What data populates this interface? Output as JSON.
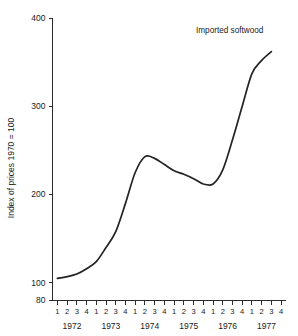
{
  "chart_data": {
    "type": "line",
    "title": "",
    "xlabel": "",
    "ylabel": "Index of prices 1970 = 100",
    "ylim": [
      80,
      400
    ],
    "yticks": [
      80,
      100,
      200,
      300,
      400
    ],
    "ytick_labels": [
      "80",
      "100",
      "200",
      "300",
      "400"
    ],
    "grid": false,
    "legend_position": "inline-annotation",
    "annotations": [
      {
        "text": "Imported softwood",
        "x": "1976 Q3",
        "y": 378
      }
    ],
    "years": [
      "1972",
      "1973",
      "1974",
      "1975",
      "1976",
      "1977"
    ],
    "quarter_labels": [
      "1",
      "2",
      "3",
      "4"
    ],
    "categories": [
      "1972 Q1",
      "1972 Q2",
      "1972 Q3",
      "1972 Q4",
      "1973 Q1",
      "1973 Q2",
      "1973 Q3",
      "1973 Q4",
      "1974 Q1",
      "1974 Q2",
      "1974 Q3",
      "1974 Q4",
      "1975 Q1",
      "1975 Q2",
      "1975 Q3",
      "1975 Q4",
      "1976 Q1",
      "1976 Q2",
      "1976 Q3",
      "1976 Q4",
      "1977 Q1",
      "1977 Q2",
      "1977 Q3",
      "1977 Q4"
    ],
    "series": [
      {
        "name": "Imported softwood",
        "color": "#232323",
        "values": [
          105,
          107,
          110,
          116,
          124,
          140,
          158,
          190,
          225,
          243,
          241,
          234,
          227,
          223,
          218,
          212,
          212,
          228,
          262,
          300,
          337,
          352,
          362,
          null
        ]
      }
    ]
  }
}
